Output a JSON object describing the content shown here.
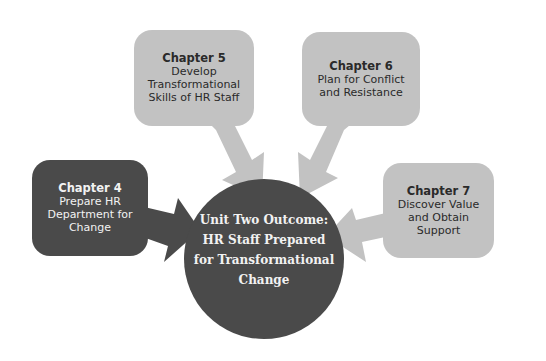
{
  "colors": {
    "light_box": "#c2c2c2",
    "dark_box": "#4a4a4a",
    "center_circle": "#4a4a4a",
    "background": "#ffffff"
  },
  "chapters": [
    {
      "id": "chapter-4",
      "title": "Chapter 4",
      "lines": [
        "Prepare HR",
        "Department for",
        "Change"
      ],
      "shade": "dark"
    },
    {
      "id": "chapter-5",
      "title": "Chapter 5",
      "lines": [
        "Develop",
        "Transformational",
        "Skills of HR Staff"
      ],
      "shade": "light"
    },
    {
      "id": "chapter-6",
      "title": "Chapter 6",
      "lines": [
        "Plan for Conflict",
        "and Resistance"
      ],
      "shade": "light"
    },
    {
      "id": "chapter-7",
      "title": "Chapter 7",
      "lines": [
        "Discover Value",
        "and Obtain",
        "Support"
      ],
      "shade": "light"
    }
  ],
  "outcome": {
    "lines": [
      "Unit Two Outcome:",
      "HR Staff Prepared",
      "for Transformational",
      "Change"
    ]
  }
}
